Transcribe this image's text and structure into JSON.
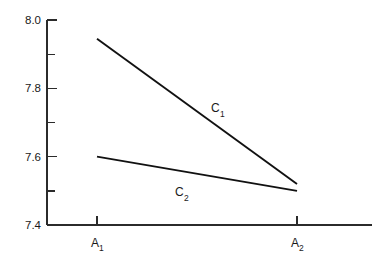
{
  "chart_data": {
    "type": "line",
    "title": "",
    "subtitle": "",
    "xlabel": "",
    "ylabel": "",
    "grid": false,
    "legend_position": "inline-annotation",
    "categories": [
      "A1",
      "A2"
    ],
    "category_labels": [
      {
        "base": "A",
        "sub": "1"
      },
      {
        "base": "A",
        "sub": "2"
      }
    ],
    "x": [
      1,
      2
    ],
    "xlim": [
      0.75,
      2.375
    ],
    "ylim": [
      7.4,
      8.0
    ],
    "yticks": [
      7.4,
      7.6,
      7.8,
      8.0
    ],
    "ytick_labels": [
      "7.4",
      "7.6",
      "7.8",
      "8.0"
    ],
    "yminor_ticks": [
      7.5,
      7.7,
      7.9
    ],
    "series": [
      {
        "name": "C1",
        "label_base": "C",
        "label_sub": "1",
        "values": [
          7.945,
          7.52
        ],
        "color": "#111111"
      },
      {
        "name": "C2",
        "label_base": "C",
        "label_sub": "2",
        "values": [
          7.6,
          7.5
        ],
        "color": "#111111"
      }
    ],
    "annotations": [
      {
        "text": "C1",
        "base": "C",
        "sub": "1",
        "x": 1.62,
        "y": 7.755
      },
      {
        "text": "C2",
        "base": "C",
        "sub": "2",
        "x": 1.42,
        "y": 7.5
      }
    ]
  },
  "axis": {
    "y_tick_labels": [
      "8.0",
      "7.8",
      "7.6",
      "7.4"
    ],
    "x_tick_label_1_base": "A",
    "x_tick_label_1_sub": "1",
    "x_tick_label_2_base": "A",
    "x_tick_label_2_sub": "2"
  },
  "series_labels": {
    "c1_base": "C",
    "c1_sub": "1",
    "c2_base": "C",
    "c2_sub": "2"
  },
  "colors": {
    "axis": "#2b2b2b",
    "line": "#111111",
    "background": "#ffffff",
    "text": "#1a1a1a"
  }
}
